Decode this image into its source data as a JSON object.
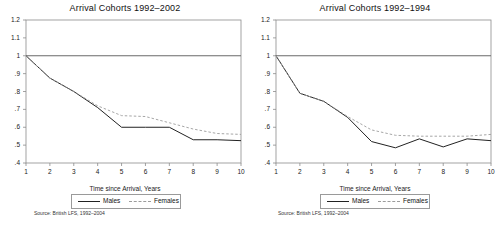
{
  "figure": {
    "panel_count": 2,
    "background": "#ffffff",
    "line_color_males": "#222222",
    "line_color_females": "#9c9c9c"
  },
  "panels": [
    {
      "title": "Arrival Cohorts 1992–2002",
      "xlabel": "Time since Arrival, Years",
      "source": "Source: British LFS, 1992–2004",
      "legend": {
        "males": "Males",
        "females": "Females"
      },
      "yticks": [
        "1.2",
        "1.1",
        "1",
        ".9",
        ".8",
        ".7",
        ".6",
        ".5",
        ".4"
      ],
      "xticks": [
        "1",
        "2",
        "3",
        "4",
        "5",
        "6",
        "7",
        "8",
        "9",
        "10"
      ]
    },
    {
      "title": "Arrival Cohorts 1992–1994",
      "xlabel": "Time since Arrival, Years",
      "source": "Source: British LFS, 1992–2004",
      "legend": {
        "males": "Males",
        "females": "Females"
      },
      "yticks": [
        "1.2",
        "1.1",
        "1",
        ".9",
        ".8",
        ".7",
        ".6",
        ".5",
        ".4"
      ],
      "xticks": [
        "1",
        "2",
        "3",
        "4",
        "5",
        "6",
        "7",
        "8",
        "9",
        "10"
      ]
    }
  ],
  "chart_data": [
    {
      "type": "line",
      "title": "Arrival Cohorts 1992–2002",
      "xlabel": "Time since Arrival, Years",
      "ylabel": "",
      "x": [
        1,
        2,
        3,
        4,
        5,
        6,
        7,
        8,
        9,
        10
      ],
      "xlim": [
        1,
        10
      ],
      "ylim": [
        0.4,
        1.2
      ],
      "ytick_values": [
        1.2,
        1.1,
        1.0,
        0.9,
        0.8,
        0.7,
        0.6,
        0.5,
        0.4
      ],
      "grid": false,
      "legend_position": "below-axis",
      "reference_line": {
        "y": 1.0,
        "style": "solid"
      },
      "series": [
        {
          "name": "Males",
          "style": "solid",
          "values": [
            1.0,
            0.875,
            0.8,
            0.71,
            0.6,
            0.6,
            0.6,
            0.53,
            0.53,
            0.525
          ]
        },
        {
          "name": "Females",
          "style": "dashed",
          "values": [
            1.0,
            0.875,
            0.8,
            0.72,
            0.665,
            0.66,
            0.625,
            0.59,
            0.565,
            0.56
          ]
        }
      ],
      "annotations": [
        "Source: British LFS, 1992–2004"
      ]
    },
    {
      "type": "line",
      "title": "Arrival Cohorts 1992–1994",
      "xlabel": "Time since Arrival, Years",
      "ylabel": "",
      "x": [
        1,
        2,
        3,
        4,
        5,
        6,
        7,
        8,
        9,
        10
      ],
      "xlim": [
        1,
        10
      ],
      "ylim": [
        0.4,
        1.2
      ],
      "ytick_values": [
        1.2,
        1.1,
        1.0,
        0.9,
        0.8,
        0.7,
        0.6,
        0.5,
        0.4
      ],
      "grid": false,
      "legend_position": "below-axis",
      "reference_line": {
        "y": 1.0,
        "style": "solid"
      },
      "series": [
        {
          "name": "Males",
          "style": "solid",
          "values": [
            1.0,
            0.79,
            0.745,
            0.655,
            0.52,
            0.485,
            0.535,
            0.49,
            0.535,
            0.525
          ]
        },
        {
          "name": "Females",
          "style": "dashed",
          "values": [
            1.0,
            0.79,
            0.745,
            0.66,
            0.585,
            0.555,
            0.55,
            0.55,
            0.55,
            0.56
          ]
        }
      ],
      "annotations": [
        "Source: British LFS, 1992–2004"
      ]
    }
  ]
}
